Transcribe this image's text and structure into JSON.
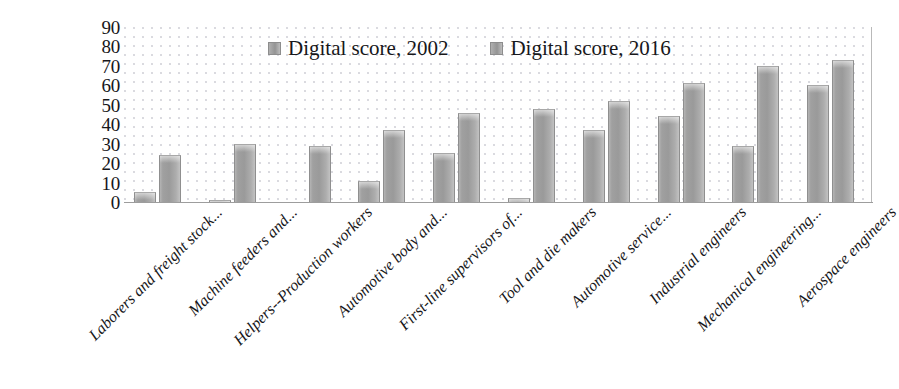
{
  "chart_data": {
    "type": "bar",
    "title": "",
    "xlabel": "",
    "ylabel": "",
    "ylim": [
      0,
      90
    ],
    "ytick_step": 10,
    "yticks": [
      "90",
      "80",
      "70",
      "60",
      "50",
      "40",
      "30",
      "20",
      "10",
      "0"
    ],
    "grid": false,
    "legend_position": "top-center",
    "categories": [
      "Laborers and freight stock...",
      "Machine feeders and...",
      "Helpers--Production workers",
      "Automotive body and...",
      "First-line supervisors of...",
      "Tool and die makers",
      "Automotive service...",
      "Industrial engineers",
      "Mechanical engineering...",
      "Aerospace engineers"
    ],
    "series": [
      {
        "name": "Digital score, 2002",
        "color": "#9a9a9a",
        "values": [
          5,
          1,
          0,
          11,
          25,
          2,
          37,
          44,
          29,
          60
        ]
      },
      {
        "name": "Digital score, 2016",
        "color": "#9a9a9a",
        "values": [
          24,
          30,
          29,
          37,
          46,
          48,
          52,
          61,
          70,
          73
        ]
      }
    ]
  },
  "legend": {
    "items": [
      {
        "label": "Digital score, 2002"
      },
      {
        "label": "Digital score, 2016"
      }
    ]
  },
  "colors": {
    "bar_fill": "#9a9a9a",
    "bar_edge": "#8f8f8f",
    "axis_line": "#9d9d9d",
    "text": "#17171a",
    "plot_background": "#ffffff"
  }
}
